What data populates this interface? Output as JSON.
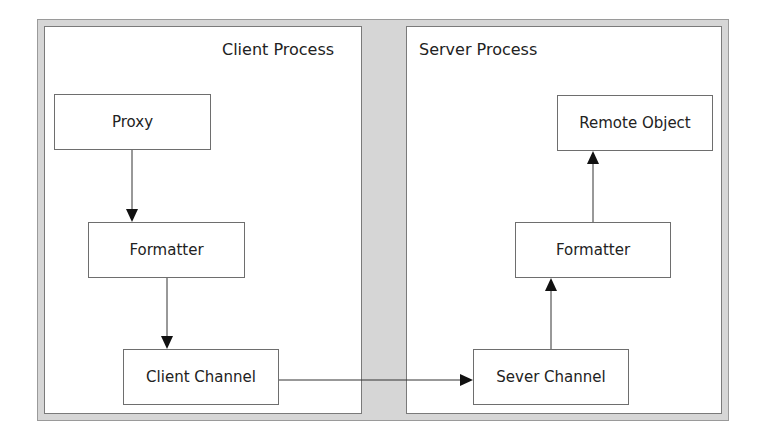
{
  "diagram": {
    "groups": [
      {
        "id": "client",
        "title": "Client Process"
      },
      {
        "id": "server",
        "title": "Server Process"
      }
    ],
    "nodes": {
      "proxy": "Proxy",
      "client_formatter": "Formatter",
      "client_channel": "Client Channel",
      "server_channel": "Sever Channel",
      "server_formatter": "Formatter",
      "remote_object": "Remote Object"
    },
    "edges": [
      {
        "from": "Proxy",
        "to": "Formatter (client)"
      },
      {
        "from": "Formatter (client)",
        "to": "Client Channel"
      },
      {
        "from": "Client Channel",
        "to": "Sever Channel"
      },
      {
        "from": "Sever Channel",
        "to": "Formatter (server)"
      },
      {
        "from": "Formatter (server)",
        "to": "Remote Object"
      }
    ],
    "colors": {
      "background_frame": "#d6d6d6",
      "panel": "#ffffff",
      "stroke": "#333333"
    }
  }
}
